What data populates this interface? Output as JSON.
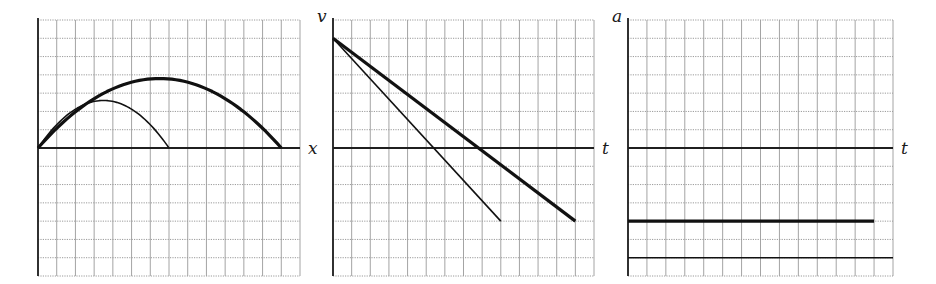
{
  "figure": {
    "panels": [
      {
        "id": "position",
        "horizontal_axis_label": "x",
        "vertical_axis_label": "",
        "left": 38,
        "top": 20,
        "right": 300,
        "bottom": 276,
        "axis_y": 148,
        "cols": 14,
        "rows": 14,
        "rows_above_axis": 7
      },
      {
        "id": "velocity",
        "horizontal_axis_label": "t",
        "vertical_axis_label": "v",
        "left": 333,
        "top": 20,
        "right": 594,
        "bottom": 276,
        "axis_y": 148,
        "cols": 14,
        "rows": 14,
        "rows_above_axis": 7
      },
      {
        "id": "acceleration",
        "horizontal_axis_label": "t",
        "vertical_axis_label": "a",
        "left": 628,
        "top": 20,
        "right": 893,
        "bottom": 276,
        "axis_y": 148,
        "cols": 14,
        "rows": 14,
        "rows_above_axis": 7
      }
    ],
    "colors": {
      "grid": "#9a9a9a",
      "axis": "#1f1f1f",
      "curve": "#111111"
    }
  },
  "chart_data": [
    {
      "type": "line",
      "title": "Trajectory (height vs horizontal position)",
      "xlabel": "x",
      "ylabel": "",
      "xlim": [
        0,
        14
      ],
      "ylim": [
        -7,
        7
      ],
      "grid": true,
      "series": [
        {
          "name": "thick trajectory",
          "style": "thick",
          "shape": "parabola",
          "x_start": 0,
          "x_end": 13,
          "peak_x": 7,
          "peak_y": 3.8
        },
        {
          "name": "thin trajectory",
          "style": "thin",
          "shape": "parabola",
          "x_start": 0,
          "x_end": 7,
          "peak_x": 3.5,
          "peak_y": 2.6
        }
      ]
    },
    {
      "type": "line",
      "title": "Velocity vs time",
      "xlabel": "t",
      "ylabel": "v",
      "xlim": [
        0,
        14
      ],
      "ylim": [
        -7,
        7
      ],
      "grid": true,
      "series": [
        {
          "name": "thick velocity",
          "style": "thick",
          "x": [
            0,
            13
          ],
          "y": [
            6,
            -4
          ]
        },
        {
          "name": "thin velocity",
          "style": "thin",
          "x": [
            0,
            9
          ],
          "y": [
            6,
            -4
          ]
        }
      ]
    },
    {
      "type": "line",
      "title": "Acceleration vs time",
      "xlabel": "t",
      "ylabel": "a",
      "xlim": [
        0,
        14
      ],
      "ylim": [
        -7,
        7
      ],
      "grid": true,
      "series": [
        {
          "name": "thick acceleration",
          "style": "thick",
          "x": [
            0,
            13
          ],
          "y": [
            -4,
            -4
          ]
        },
        {
          "name": "thin acceleration",
          "style": "thin",
          "x": [
            0,
            14
          ],
          "y": [
            -6,
            -6
          ]
        }
      ]
    }
  ]
}
